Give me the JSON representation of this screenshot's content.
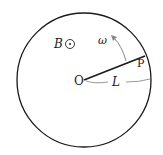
{
  "diagram": {
    "labels": {
      "field": "B",
      "omega": "ω",
      "point": "P",
      "origin": "O",
      "length": "L"
    },
    "field_symbol": "out-of-page-dot",
    "colors": {
      "stroke": "#1a1a1a",
      "arrow": "#888888"
    }
  }
}
